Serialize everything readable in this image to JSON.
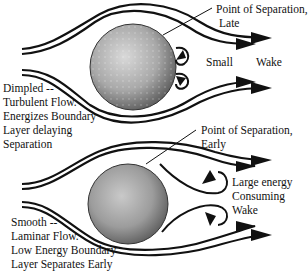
{
  "diagram": {
    "type": "flow-comparison",
    "colors": {
      "line": "#111111",
      "ball_light": "#d8d8d8",
      "ball_dark": "#6a6a6a",
      "background": "#ffffff"
    },
    "top": {
      "name": "dimpled-ball",
      "separation_label": [
        "Point of Separation,",
        "Late"
      ],
      "wake_label_left": "Small",
      "wake_label_right": "Wake",
      "description": [
        "Dimpled --",
        "Turbulent Flow.",
        "Energizes Boundary",
        "Layer delaying",
        "Separation"
      ]
    },
    "bottom": {
      "name": "smooth-ball",
      "separation_label": [
        "Point of Separation,",
        "Early"
      ],
      "wake_label": [
        "Large energy",
        "Consuming",
        "Wake"
      ],
      "description": [
        "Smooth --",
        "Laminar Flow.",
        "Low Energy Boundary",
        "Layer Separates Early"
      ]
    }
  }
}
